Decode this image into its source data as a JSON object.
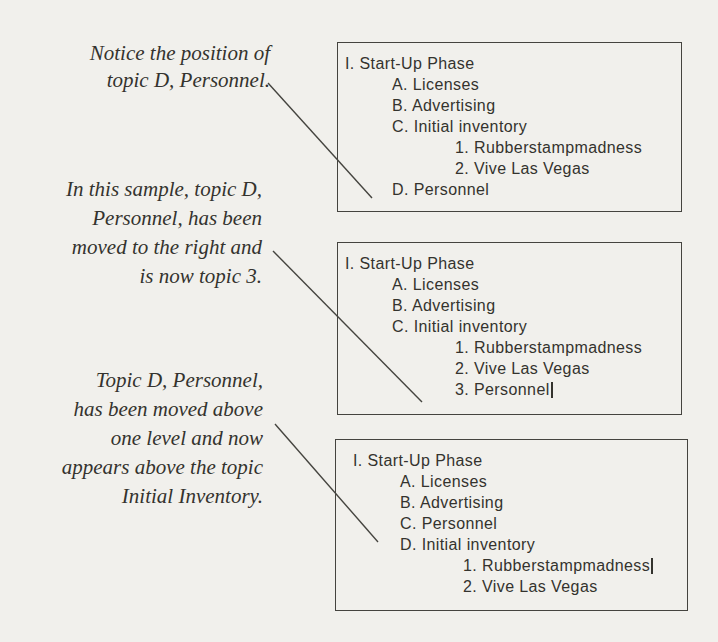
{
  "page": {
    "paper_color": "#f1f0ec",
    "line_color": "#45443f",
    "text_color": "#34332e"
  },
  "annotations": [
    {
      "text": "Notice the position of\ntopic D, Personnel."
    },
    {
      "text": "In this sample, topic D,\nPersonnel, has been\nmoved to the right and\nis now topic 3."
    },
    {
      "text": "Topic D, Personnel,\nhas been moved above\none level and now\nappears above the topic\nInitial Inventory."
    }
  ],
  "outline_boxes": [
    {
      "items": [
        {
          "text": "I. Start-Up Phase",
          "level": 0
        },
        {
          "text": "A. Licenses",
          "level": 1
        },
        {
          "text": "B. Advertising",
          "level": 1
        },
        {
          "text": "C. Initial inventory",
          "level": 1
        },
        {
          "text": "1. Rubberstampmadness",
          "level": 2
        },
        {
          "text": "2. Vive Las Vegas",
          "level": 2
        },
        {
          "text": "D. Personnel",
          "level": 1
        }
      ]
    },
    {
      "items": [
        {
          "text": "I. Start-Up Phase",
          "level": 0
        },
        {
          "text": "A. Licenses",
          "level": 1
        },
        {
          "text": "B. Advertising",
          "level": 1
        },
        {
          "text": "C. Initial inventory",
          "level": 1
        },
        {
          "text": "1. Rubberstampmadness",
          "level": 2
        },
        {
          "text": "2. Vive Las Vegas",
          "level": 2
        },
        {
          "text": "3. Personnel",
          "level": 2,
          "cursor": true
        }
      ]
    },
    {
      "items": [
        {
          "text": "I. Start-Up Phase",
          "level": 0
        },
        {
          "text": "A. Licenses",
          "level": 1
        },
        {
          "text": "B. Advertising",
          "level": 1
        },
        {
          "text": "C. Personnel",
          "level": 1
        },
        {
          "text": "D. Initial inventory",
          "level": 1
        },
        {
          "text": "1. Rubberstampmadness",
          "level": 2,
          "cursor": true
        },
        {
          "text": "2. Vive Las Vegas",
          "level": 2
        }
      ]
    }
  ]
}
